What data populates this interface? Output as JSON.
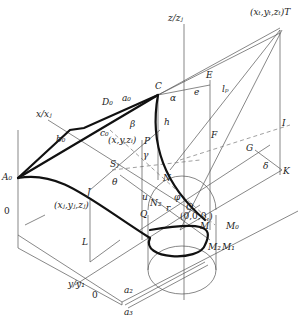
{
  "diagram": {
    "type": "3d-geometric-construction",
    "axes": {
      "z": "z/z",
      "z_sub": "j",
      "x": "x/x",
      "x_sub": "j",
      "y": "y/y",
      "y_sub": "1"
    },
    "points": {
      "T": "(x",
      "T_full": "(x_t, y_t, z_t) T",
      "C": "C",
      "E": "E",
      "F": "F",
      "I": "I",
      "G": "G",
      "K": "K",
      "D0": "D",
      "A0": "A",
      "P": "P",
      "Sj": "S",
      "J": "J",
      "J_coord": "(x_j, y_j, z_j)",
      "Q": "Q",
      "N": "N",
      "N2": "N",
      "O": "O",
      "O_coord": "(0,0,0,)",
      "M": "M",
      "M0": "M",
      "M1": "M",
      "M2": "M",
      "L": "L",
      "P_coord": "(x, y, z_i)"
    },
    "labels": {
      "T": "(xₜ,yₜ,zₜ)T",
      "zaxis": "z/zⱼ",
      "xaxis": "x/xⱼ",
      "yaxis": "y/y₁",
      "C": "C",
      "E": "E",
      "e": "e",
      "lp": "lₚ",
      "alpha": "α",
      "h": "h",
      "F": "F",
      "I": "I",
      "G": "G",
      "delta": "δ",
      "K": "K",
      "D0": "D₀",
      "a0": "a₀",
      "beta": "β",
      "b0": "b₀",
      "c0": "c₀",
      "xyz": "(x,y,zᵢ)",
      "P": "P",
      "gamma": "γ",
      "A0": "A₀",
      "Sj": "Sⱼ",
      "theta": "θ",
      "J": "J",
      "Jcoord": "(xⱼ,yⱼ,zⱼ)",
      "u": "u",
      "N": "N",
      "N2": "N₂",
      "r": "r",
      "phi": "φ",
      "O": "O",
      "origin": "(0,0,0,)",
      "Q": "Q",
      "M": "M",
      "M0": "M₀",
      "M1": "M₁",
      "M2": "M₂",
      "L": "L",
      "zero_left": "0",
      "zero_bottom": "0",
      "a2": "a₂",
      "a3": "a₃"
    }
  }
}
